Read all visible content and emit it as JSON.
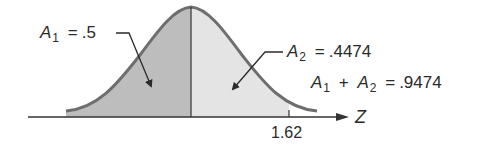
{
  "diagram": {
    "type": "normal-distribution-area",
    "axis_label": "Z",
    "tick_label": "1.62",
    "center_value": "0",
    "regions": [
      {
        "name": "A1",
        "var": "A",
        "sub": "1",
        "value": ".5",
        "description": "left half, z < 0",
        "fill": "#bdbdbd"
      },
      {
        "name": "A2",
        "var": "A",
        "sub": "2",
        "value": ".4474",
        "description": "0 < z < 1.62",
        "fill": "#e4e4e4"
      }
    ],
    "sum_label": {
      "a": "A",
      "a_sub": "1",
      "plus": "+",
      "b": "A",
      "b_sub": "2",
      "equals": "=",
      "value": ".9474"
    },
    "equals": "=",
    "colors": {
      "curve": "#6e6e6e",
      "axis": "#333333",
      "left_fill": "#bdbdbd",
      "right_fill": "#e4e4e4",
      "text": "#2a2a2a"
    }
  }
}
